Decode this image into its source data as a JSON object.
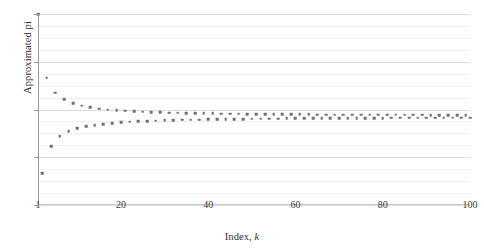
{
  "figure": {
    "background": "#ffffff",
    "marker_color": "#6f6f78",
    "grid_color": "#e9e9ee",
    "axis_color": "#9a9aa2"
  },
  "axes": {
    "ylabel": "Approximated pi",
    "xlabel_prefix": "Index, ",
    "xlabel_variable": "k",
    "ytick_labels": [
      "2.4",
      "2.8",
      "3.2",
      "3.6",
      "4.0"
    ],
    "xtick_labels": [
      "1",
      "20",
      "40",
      "60",
      "80",
      "100"
    ]
  },
  "chart_data": {
    "type": "scatter",
    "title": "",
    "xlabel": "Index, k",
    "ylabel": "Approximated pi",
    "xlim": [
      1,
      100
    ],
    "ylim": [
      2.4,
      4.0
    ],
    "xticks": [
      1,
      20,
      40,
      60,
      80,
      100
    ],
    "yticks": [
      2.4,
      2.8,
      3.2,
      3.6,
      4.0
    ],
    "yticks_minor_step": 0.1,
    "grid": true,
    "legend": "none",
    "marker": "square",
    "marker_size": 2.6,
    "series": [
      {
        "name": "Leibniz partial sum",
        "x": [
          1,
          2,
          3,
          4,
          5,
          6,
          7,
          8,
          9,
          10,
          11,
          12,
          13,
          14,
          15,
          16,
          17,
          18,
          19,
          20,
          21,
          22,
          23,
          24,
          25,
          26,
          27,
          28,
          29,
          30,
          31,
          32,
          33,
          34,
          35,
          36,
          37,
          38,
          39,
          40,
          41,
          42,
          43,
          44,
          45,
          46,
          47,
          48,
          49,
          50,
          51,
          52,
          53,
          54,
          55,
          56,
          57,
          58,
          59,
          60,
          61,
          62,
          63,
          64,
          65,
          66,
          67,
          68,
          69,
          70,
          71,
          72,
          73,
          74,
          75,
          76,
          77,
          78,
          79,
          80,
          81,
          82,
          83,
          84,
          85,
          86,
          87,
          88,
          89,
          90,
          91,
          92,
          93,
          94,
          95,
          96,
          97,
          98,
          99,
          100
        ],
        "values": [
          4.0,
          2.667,
          3.467,
          2.895,
          3.34,
          2.976,
          3.284,
          3.017,
          3.252,
          3.042,
          3.232,
          3.058,
          3.218,
          3.07,
          3.208,
          3.079,
          3.2,
          3.087,
          3.194,
          3.092,
          3.189,
          3.097,
          3.185,
          3.101,
          3.182,
          3.104,
          3.179,
          3.107,
          3.176,
          3.109,
          3.174,
          3.111,
          3.172,
          3.113,
          3.171,
          3.115,
          3.169,
          3.116,
          3.168,
          3.117,
          3.167,
          3.119,
          3.166,
          3.12,
          3.165,
          3.121,
          3.164,
          3.121,
          3.163,
          3.122,
          3.162,
          3.123,
          3.162,
          3.124,
          3.161,
          3.124,
          3.16,
          3.125,
          3.16,
          3.125,
          3.159,
          3.126,
          3.159,
          3.126,
          3.158,
          3.127,
          3.158,
          3.127,
          3.158,
          3.128,
          3.157,
          3.128,
          3.157,
          3.128,
          3.156,
          3.129,
          3.156,
          3.129,
          3.156,
          3.129,
          3.156,
          3.13,
          3.155,
          3.13,
          3.155,
          3.13,
          3.155,
          3.13,
          3.155,
          3.131,
          3.154,
          3.131,
          3.154,
          3.131,
          3.154,
          3.131,
          3.154,
          3.131,
          3.154,
          3.132
        ]
      }
    ]
  }
}
